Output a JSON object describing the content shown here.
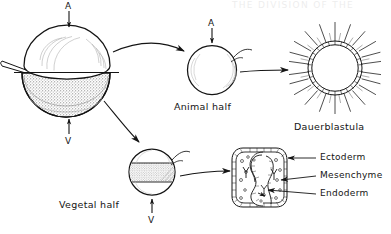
{
  "figure": {
    "title_faint": "THE DIVISION OF THE",
    "axis_markers": {
      "animal_top": "A",
      "animal_center": "A",
      "vegetal_bottom": "V",
      "vegetal_half_bottom": "V"
    },
    "captions": {
      "animal_half": "Animal half",
      "vegetal_half": "Vegetal half",
      "dauerblastula": "Dauerblastula"
    },
    "callouts": [
      {
        "label": "Ectoderm"
      },
      {
        "label": "Mesenchyme"
      },
      {
        "label": "Endoderm"
      }
    ],
    "colors": {
      "ink": "#141414",
      "stipple": "#7d7d7d",
      "paper": "#ffffff"
    }
  }
}
